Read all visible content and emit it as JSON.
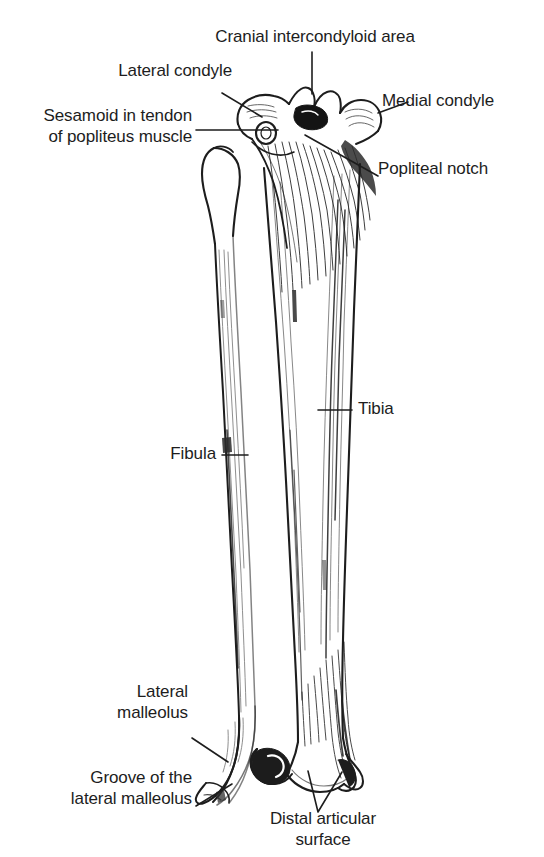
{
  "figure": {
    "background_color": "#ffffff",
    "ink_color": "#1d1d1d",
    "width": 544,
    "height": 857
  },
  "labels": {
    "cranial_intercondyloid_area": "Cranial intercondyloid area",
    "lateral_condyle": "Lateral condyle",
    "medial_condyle": "Medial condyle",
    "sesamoid_line1": "Sesamoid in tendon",
    "sesamoid_line2": "of popliteus muscle",
    "popliteal_notch": "Popliteal notch",
    "tibia": "Tibia",
    "fibula": "Fibula",
    "lateral_malleolus_line1": "Lateral",
    "lateral_malleolus_line2": "malleolus",
    "groove_line1": "Groove of the",
    "groove_line2": "lateral malleolus",
    "distal_articular_line1": "Distal articular",
    "distal_articular_line2": "surface"
  },
  "structures": [
    {
      "name": "tibia",
      "label": "Tibia"
    },
    {
      "name": "fibula",
      "label": "Fibula"
    },
    {
      "name": "lateral-condyle",
      "label": "Lateral condyle"
    },
    {
      "name": "medial-condyle",
      "label": "Medial condyle"
    },
    {
      "name": "cranial-intercondyloid-area",
      "label": "Cranial intercondyloid area"
    },
    {
      "name": "popliteal-notch",
      "label": "Popliteal notch"
    },
    {
      "name": "sesamoid-popliteus",
      "label": "Sesamoid in tendon of popliteus muscle"
    },
    {
      "name": "lateral-malleolus",
      "label": "Lateral malleolus"
    },
    {
      "name": "groove-of-lateral-malleolus",
      "label": "Groove of the lateral malleolus"
    },
    {
      "name": "distal-articular-surface",
      "label": "Distal articular surface"
    }
  ]
}
